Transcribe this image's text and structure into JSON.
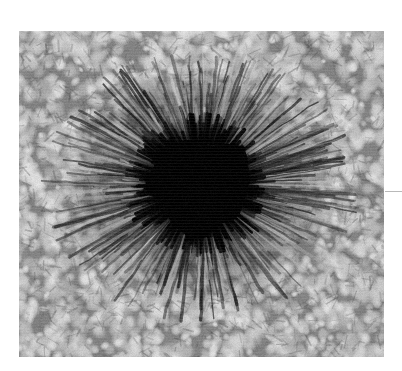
{
  "figure": {
    "kind": "grayscale-astronomical-photograph",
    "subject_name": "sunspot",
    "plate": {
      "x": 19,
      "y": 31,
      "width": 365,
      "height": 326,
      "background_hex": "#9d9d9d",
      "page_background_hex": "#ffffff"
    },
    "edge_mark": {
      "name": "right-margin-tick",
      "x": 385,
      "y": 191,
      "width": 17,
      "height": 1,
      "color_hex": "#b9b9b9"
    }
  },
  "render": {
    "seed": 20240517,
    "granulation": {
      "cell_count": 2600,
      "cell_radius_min": 3.0,
      "cell_radius_max": 9.5,
      "cell_bright_hex": "#d8d8d8",
      "lane_dark_hex": "#6b6b6b",
      "mean_level": 158,
      "contrast": 46
    },
    "umbra": {
      "center_x": 181,
      "center_y": 154,
      "radius": 48,
      "irregularity": 0.16,
      "core_hex": "#030303",
      "level": 6
    },
    "penumbra": {
      "center_x": 181,
      "center_y": 154,
      "inner_radius": 44,
      "outer_radius": 124,
      "radius_scale_x": 1.12,
      "radius_scale_y": 0.96,
      "filament_count": 560,
      "filament_width_min": 1.1,
      "filament_width_max": 3.4,
      "bright_hex": "#c4c4c4",
      "dark_hex": "#1a1a1a",
      "mean_level": 74
    },
    "veil": {
      "name": "upper-left-dark-streak",
      "x": 96,
      "y": 86,
      "length": 86,
      "thickness": 14,
      "angle_deg": 22,
      "opacity": 0.2
    },
    "noise": {
      "amplitude": 7,
      "scanline_opacity": 0.05
    },
    "vignette_opacity": 0.06
  },
  "labels": {
    "plate_title": "",
    "caption": ""
  }
}
